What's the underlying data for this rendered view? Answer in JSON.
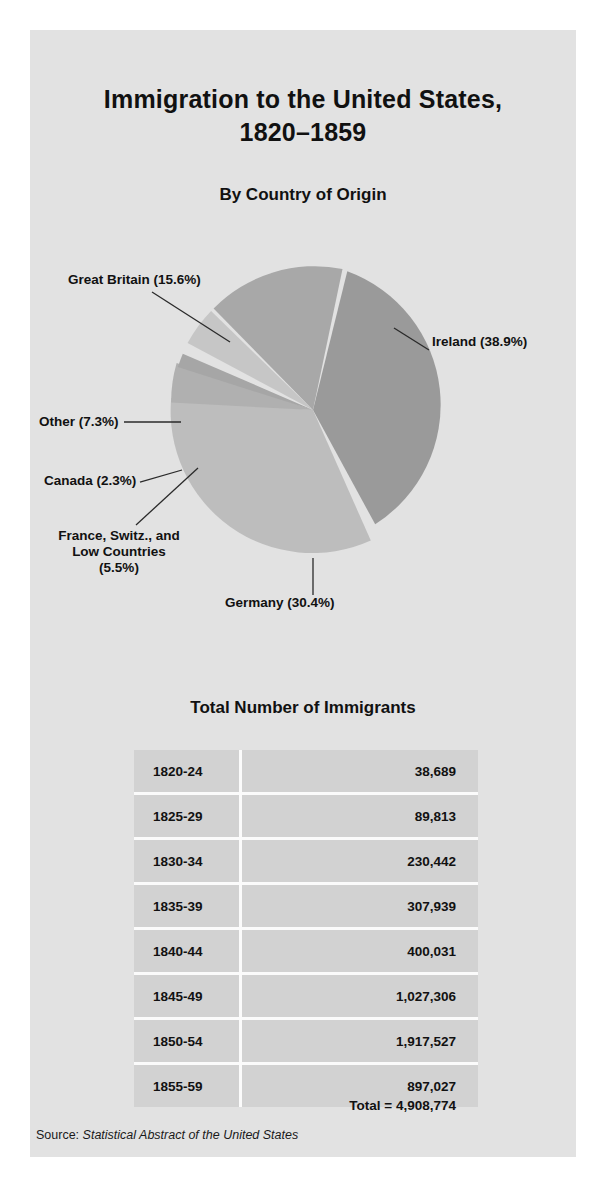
{
  "figure": {
    "title_line1": "Immigration to the United States,",
    "title_line2": "1820–1859",
    "subtitle": "By Country of Origin",
    "table_title": "Total Number of Immigrants",
    "total_label": "Total  =  4,908,774",
    "source_label": "Source:",
    "source_title": "Statistical Abstract of the United States"
  },
  "colors": {
    "page_background": "#ffffff",
    "card_background": "#e2e2e2",
    "table_cell": "#d2d2d2",
    "grid_line": "#fbfbfb",
    "text": "#111111",
    "slice_dark": "#9a9a9a",
    "slice_mid": "#aeaeae",
    "slice_light": "#c2c2c2",
    "leader_line": "#2a2a2a"
  },
  "chart_data": {
    "type": "pie",
    "title": "Immigration to the United States, 1820–1859",
    "subtitle": "By Country of Origin",
    "unit": "percent",
    "legend": "labels with leader lines",
    "labels": [
      "Ireland (38.9%)",
      "Germany (30.4%)",
      "France, Switz., and Low Countries (5.5%)",
      "Canada (2.3%)",
      "Other (7.3%)",
      "Great Britain (15.6%)"
    ],
    "categories": [
      "Ireland",
      "Germany",
      "France, Switz., and Low Countries",
      "Canada",
      "Other",
      "Great Britain"
    ],
    "values": [
      38.9,
      30.4,
      5.5,
      2.3,
      7.3,
      15.6
    ],
    "slices": [
      {
        "name": "Ireland",
        "label": "Ireland (38.9%)",
        "percent": 38.9,
        "fill": "#9a9a9a"
      },
      {
        "name": "Germany",
        "label": "Germany (30.4%)",
        "percent": 30.4,
        "fill": "#bdbdbd"
      },
      {
        "name": "France, Switz., and Low Countries",
        "label": "France, Switz., and Low Countries (5.5%)",
        "percent": 5.5,
        "fill": "#b0b0b0"
      },
      {
        "name": "Canada",
        "label": "Canada (2.3%)",
        "percent": 2.3,
        "fill": "#a6a6a6"
      },
      {
        "name": "Other",
        "label": "Other (7.3%)",
        "percent": 7.3,
        "fill": "#c6c6c6"
      },
      {
        "name": "Great Britain",
        "label": "Great Britain (15.6%)",
        "percent": 15.6,
        "fill": "#a8a8a8"
      }
    ]
  },
  "pie_labels": {
    "great_britain": "Great Britain (15.6%)",
    "ireland": "Ireland (38.9%)",
    "other": "Other (7.3%)",
    "canada": "Canada (2.3%)",
    "france_line1": "France, Switz., and",
    "france_line2": "Low Countries",
    "france_line3": "(5.5%)",
    "germany": "Germany (30.4%)"
  },
  "table": {
    "columns": [
      "Period",
      "Immigrants"
    ],
    "rows": [
      {
        "period": "1820-24",
        "value": "38,689"
      },
      {
        "period": "1825-29",
        "value": "89,813"
      },
      {
        "period": "1830-34",
        "value": "230,442"
      },
      {
        "period": "1835-39",
        "value": "307,939"
      },
      {
        "period": "1840-44",
        "value": "400,031"
      },
      {
        "period": "1845-49",
        "value": "1,027,306"
      },
      {
        "period": "1850-54",
        "value": "1,917,527"
      },
      {
        "period": "1855-59",
        "value": "897,027"
      }
    ],
    "total": "Total  =  4,908,774"
  }
}
